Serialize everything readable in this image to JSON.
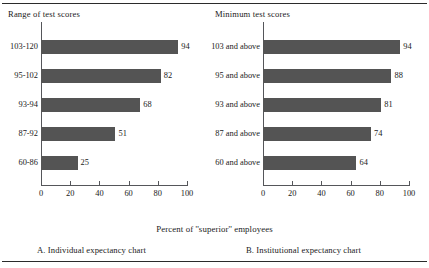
{
  "figure": {
    "axis_caption": "Percent of ''superior'' employees",
    "bar_color": "#545454",
    "axis_color": "#55565a",
    "rule_color": "#2b2b2b"
  },
  "chart_data": [
    {
      "type": "bar",
      "orientation": "horizontal",
      "title": "A. Individual expectancy chart",
      "column_header": "Range of test scores",
      "categories": [
        "103-120",
        "95-102",
        "93-94",
        "87-92",
        "60-86"
      ],
      "values": [
        94,
        82,
        68,
        51,
        25
      ],
      "xlabel": "Percent of ''superior'' employees",
      "ylabel": "Range of test scores",
      "xlim": [
        0,
        100
      ],
      "xticks": [
        0,
        20,
        40,
        60,
        80,
        100
      ],
      "xtick_labels": [
        "0",
        "20",
        "40",
        "60",
        "80",
        "100"
      ],
      "grid": false,
      "legend": false,
      "data_labels": true
    },
    {
      "type": "bar",
      "orientation": "horizontal",
      "title": "B. Institutional expectancy chart",
      "column_header": "Minimum test scores",
      "categories": [
        "103 and above",
        "95 and above",
        "93 and above",
        "87 and above",
        "60 and above"
      ],
      "values": [
        94,
        88,
        81,
        74,
        64
      ],
      "xlabel": "Percent of ''superior'' employees",
      "ylabel": "Minimum test scores",
      "xlim": [
        0,
        100
      ],
      "xticks": [
        0,
        20,
        40,
        60,
        80,
        100
      ],
      "xtick_labels": [
        "0",
        "20",
        "40",
        "60",
        "80",
        "100"
      ],
      "grid": false,
      "legend": false,
      "data_labels": true
    }
  ]
}
